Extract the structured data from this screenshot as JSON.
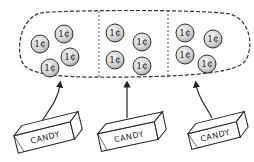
{
  "diagram": {
    "groups": [
      {
        "coins": [
          "1¢",
          "1¢",
          "1¢",
          "1¢"
        ],
        "candy_label": "CANDY"
      },
      {
        "coins": [
          "1¢",
          "1¢",
          "1¢",
          "1¢"
        ],
        "candy_label": "CANDY"
      },
      {
        "coins": [
          "1¢",
          "1¢",
          "1¢",
          "1¢"
        ],
        "candy_label": "CANDY"
      }
    ],
    "colors": {
      "ink": "#222222",
      "coin_fill": "#d8d8d8",
      "background": "#ffffff"
    }
  }
}
